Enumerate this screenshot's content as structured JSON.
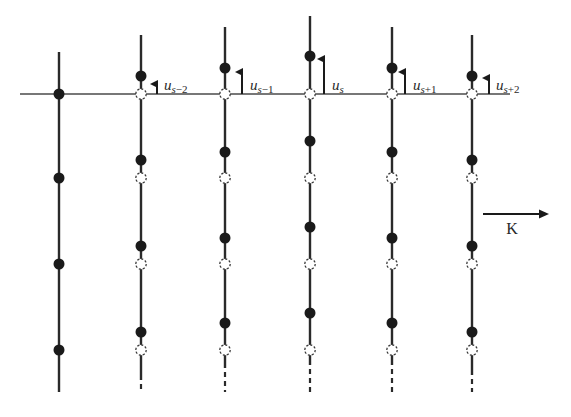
{
  "diagram": {
    "type": "lattice-wave-displacement",
    "colors": {
      "line": "#2a2a2a",
      "solid_dot": "#1a1a1a",
      "open_dot": "#3a3a3a",
      "background": "#ffffff"
    },
    "reference_line": {
      "y": 94,
      "x1": 20,
      "x2": 510
    },
    "equilibrium_ys": [
      94,
      178,
      264,
      350
    ],
    "reference_column": {
      "x": 59,
      "y1": 52,
      "y2": 392,
      "dots": [
        94,
        178,
        264,
        350
      ]
    },
    "planes": [
      {
        "id": "s-2",
        "x": 141,
        "offset": -18,
        "y1": 35,
        "y2": 380,
        "dash_to": 392,
        "dots": [
          76,
          160,
          246,
          332
        ],
        "arrow": {
          "x": 157,
          "y_tip": 78
        },
        "label": {
          "base": "u",
          "sub": "s−2",
          "x": 164
        }
      },
      {
        "id": "s-1",
        "x": 225,
        "offset": -26,
        "y1": 27,
        "y2": 368,
        "dash_to": 392,
        "dots": [
          68,
          152,
          238,
          323
        ],
        "arrow": {
          "x": 242,
          "y_tip": 66
        },
        "label": {
          "base": "u",
          "sub": "s−1",
          "x": 250
        }
      },
      {
        "id": "s",
        "x": 310,
        "offset": -38,
        "y1": 16,
        "y2": 365,
        "dash_to": 392,
        "dots": [
          56,
          141,
          227,
          313
        ],
        "arrow": {
          "x": 324,
          "y_tip": 53
        },
        "label": {
          "base": "u",
          "sub": "s",
          "x": 332
        }
      },
      {
        "id": "s+1",
        "x": 392,
        "offset": -26,
        "y1": 27,
        "y2": 365,
        "dash_to": 392,
        "dots": [
          68,
          152,
          238,
          323
        ],
        "arrow": {
          "x": 405,
          "y_tip": 66
        },
        "label": {
          "base": "u",
          "sub": "s+1",
          "x": 413
        }
      },
      {
        "id": "s+2",
        "x": 472,
        "offset": -18,
        "y1": 35,
        "y2": 375,
        "dash_to": 392,
        "dots": [
          76,
          160,
          246,
          332
        ],
        "arrow": {
          "x": 489,
          "y_tip": 72
        },
        "label": {
          "base": "u",
          "sub": "s+2",
          "x": 496
        }
      }
    ],
    "wavevector": {
      "label": "K",
      "x1": 483,
      "x2": 549,
      "y": 214,
      "label_x": 512,
      "label_y": 234
    }
  }
}
